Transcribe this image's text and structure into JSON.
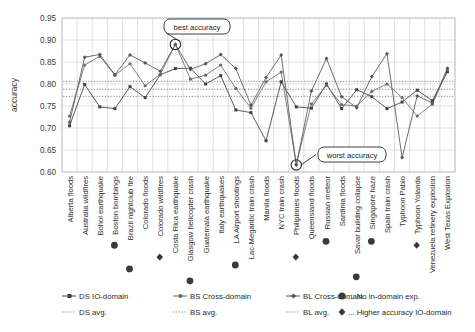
{
  "chart_data": {
    "type": "line",
    "title": "",
    "xlabel": "",
    "ylabel": "accuracy",
    "ylim": [
      0.6,
      0.95
    ],
    "ytick_step": 0.05,
    "yticks": [
      "0.60",
      "0.65",
      "0.70",
      "0.75",
      "0.80",
      "0.85",
      "0.90",
      "0.95"
    ],
    "grid": true,
    "legend_position": "bottom",
    "categories": [
      "Alberta floods",
      "Australia wildfires",
      "Bohol earthquake",
      "Boston bombings",
      "Brazil nightclub fire",
      "Colorado floods",
      "Colorado wildfires",
      "Costa Rica earthquake",
      "Glasgow helicopter crash",
      "Guatemala earthquake",
      "Italy earthquakes",
      "LA Airport shootings",
      "Lac-Megantic train crash",
      "Manila floods",
      "NYC train crash",
      "Philipinnes floods",
      "Queensland floods",
      "Russian meteor",
      "Sardinia floods",
      "Savar building collapse",
      "Singapore haze",
      "Spain train crash",
      "Typhoon Pablo",
      "Typhoon Yolanda",
      "Venezuela refinery explosion",
      "West Texas Explosion"
    ],
    "series": [
      {
        "name": "DS IO-domain",
        "marker": "square",
        "values": [
          0.705,
          0.799,
          0.748,
          0.744,
          0.794,
          0.769,
          0.821,
          0.835,
          0.836,
          0.8,
          0.819,
          0.741,
          0.735,
          0.671,
          0.805,
          0.748,
          0.745,
          0.8,
          0.744,
          0.787,
          0.771,
          0.744,
          0.759,
          0.786,
          0.762,
          0.828
        ]
      },
      {
        "name": "BS Cross-domain",
        "marker": "circle",
        "values": [
          0.727,
          0.843,
          0.863,
          0.82,
          0.846,
          0.796,
          0.822,
          0.89,
          0.811,
          0.82,
          0.843,
          0.79,
          0.745,
          0.805,
          0.827,
          0.617,
          0.755,
          0.797,
          0.753,
          0.75,
          0.783,
          0.8,
          0.769,
          0.727,
          0.754,
          0.832
        ]
      },
      {
        "name": "BL Cross-domain",
        "marker": "diamond",
        "values": [
          0.713,
          0.861,
          0.867,
          0.821,
          0.866,
          0.848,
          0.829,
          0.89,
          0.833,
          0.846,
          0.867,
          0.835,
          0.752,
          0.815,
          0.866,
          0.616,
          0.784,
          0.858,
          0.771,
          0.746,
          0.817,
          0.869,
          0.633,
          0.773,
          0.757,
          0.836
        ]
      }
    ],
    "averages": [
      {
        "name": "DS avg.",
        "value": 0.772
      },
      {
        "name": "BS avg.",
        "value": 0.788
      },
      {
        "name": "BL avg.",
        "value": 0.806
      }
    ],
    "annotations": [
      {
        "label": "best accuracy",
        "category": "Costa Rica earthquake",
        "value": 0.89
      },
      {
        "label": "worst accuracy",
        "category": "Philipinnes floods",
        "value": 0.616
      }
    ],
    "category_markers": {
      "circle": [
        "Boston bombings",
        "Brazil nightclub fire",
        "Glasgow helicopter crash",
        "LA Airport shootings",
        "Russian meteor",
        "Savar building collapse",
        "Singapore haze"
      ],
      "diamond": [
        "Colorado wildfires",
        "Philipinnes floods",
        "Typhoon Yolanda"
      ]
    }
  },
  "legend": {
    "row1": [
      {
        "label": "DS IO-domain",
        "marker": "square",
        "style": "solid"
      },
      {
        "label": "BS Cross-domain",
        "marker": "circle",
        "style": "solid"
      },
      {
        "label": "BL Cross-domain",
        "marker": "diamond",
        "style": "solid"
      },
      {
        "label": "... No in-domain exp.",
        "marker": "big-circle",
        "style": "none"
      }
    ],
    "row2": [
      {
        "label": "DS avg.",
        "marker": "none",
        "style": "dotted"
      },
      {
        "label": "BS avg.",
        "marker": "none",
        "style": "dotted"
      },
      {
        "label": "BL avg.",
        "marker": "none",
        "style": "dotted"
      },
      {
        "label": "... Higher accuracy IO-domain",
        "marker": "big-diamond",
        "style": "none"
      }
    ]
  },
  "colors": {
    "line_ds": "#3f3f3f",
    "line_bs": "#6b6b6b",
    "line_bl": "#555555",
    "grid": "#c9d3dd",
    "avg_line": "#8a8a8a",
    "text": "#2e2e2e",
    "callout_border": "#2b2b2b"
  }
}
